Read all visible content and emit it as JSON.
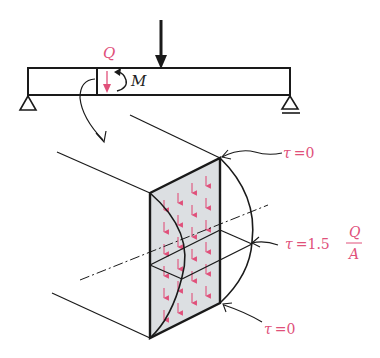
{
  "diagram": {
    "colors": {
      "stroke": "#1a1a1a",
      "accent": "#e0507a",
      "face_fill": "#dcdfe2"
    },
    "beam": {
      "shear_label": "Q",
      "moment_label": "M",
      "load": "concentrated downward load",
      "supports": [
        "pin (left)",
        "roller (right)"
      ]
    },
    "annotations": {
      "top": {
        "symbol": "τ",
        "eq": "=",
        "value": "0"
      },
      "middle": {
        "symbol": "τ",
        "eq": "=",
        "coef": "1.5",
        "num": "Q",
        "den": "A"
      },
      "bottom": {
        "symbol": "τ",
        "eq": "=",
        "value": "0"
      }
    }
  }
}
